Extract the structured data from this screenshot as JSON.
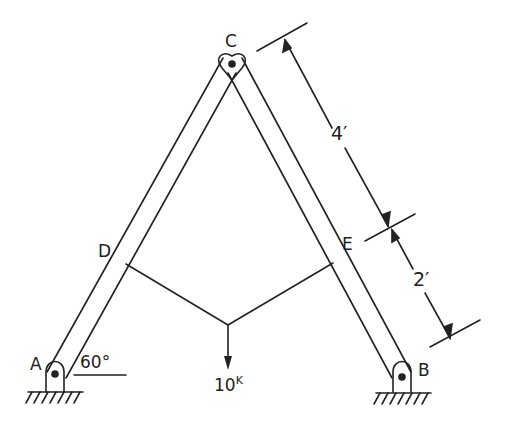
{
  "diagram": {
    "type": "A-frame truss with cable and point load",
    "colors": {
      "ink": "#222222",
      "background": "#ffffff"
    },
    "joints": {
      "A": {
        "label": "A",
        "support": "pin"
      },
      "B": {
        "label": "B",
        "support": "pin"
      },
      "C": {
        "label": "C",
        "connection": "pin"
      },
      "D": {
        "label": "D"
      },
      "E": {
        "label": "E"
      }
    },
    "angle": {
      "label": "60°"
    },
    "load": {
      "value": "10",
      "unit": "K"
    },
    "dimensions": [
      {
        "label": "4′"
      },
      {
        "label": "2′"
      }
    ]
  }
}
